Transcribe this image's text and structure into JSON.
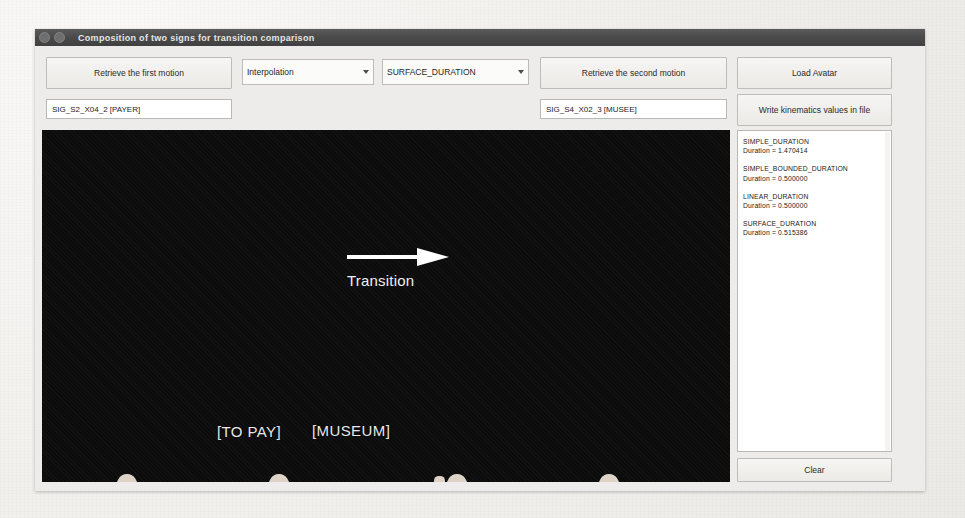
{
  "window": {
    "title": "Composition of two signs for transition comparison",
    "titlebar_buttons": [
      "window-menu-icon",
      "window-help-icon"
    ]
  },
  "toolbar": {
    "retrieve_first_label": "Retrieve the first motion",
    "retrieve_second_label": "Retrieve the second motion",
    "load_avatar_label": "Load Avatar",
    "write_kinematics_label": "Write kinematics values in file",
    "clear_label": "Clear",
    "interpolation_combo": {
      "value": "Interpolation",
      "options": [
        "Interpolation"
      ]
    },
    "duration_combo": {
      "value": "SURFACE_DURATION",
      "options": [
        "SIMPLE_DURATION",
        "SIMPLE_BOUNDED_DURATION",
        "LINEAR_DURATION",
        "SURFACE_DURATION"
      ]
    }
  },
  "fields": {
    "first_motion": {
      "value": "SIG_S2_X04_2 [PAYER]",
      "placeholder": ""
    },
    "second_motion": {
      "value": "SIG_S4_X02_3 [MUSEE]",
      "placeholder": ""
    }
  },
  "viewport": {
    "background_color": "#0c0c0c",
    "first_sign_caption": "[TO PAY]",
    "second_sign_caption": "[MUSEUM]",
    "transition_label": "Transition",
    "transition_arrow_icon": "arrow-right-icon",
    "avatar_count": 4
  },
  "results": {
    "metrics": [
      {
        "name": "SIMPLE_DURATION",
        "value": "Duration  = 1.470414"
      },
      {
        "name": "SIMPLE_BOUNDED_DURATION",
        "value": "Duration  = 0.500000"
      },
      {
        "name": "LINEAR_DURATION",
        "value": "Duration  = 0.500000"
      },
      {
        "name": "SURFACE_DURATION",
        "value": "Duration  = 0.515386"
      }
    ]
  },
  "colors": {
    "titlebar": "#4a4a4a",
    "panel": "#edecea",
    "viewport": "#0c0c0c",
    "avatar_skin": "#cfc5b8",
    "arrow": "#ffffff"
  }
}
